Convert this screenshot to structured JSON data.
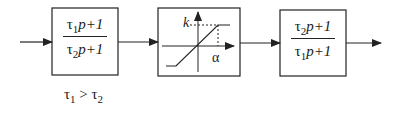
{
  "diagram": {
    "type": "block-diagram",
    "blocks": [
      {
        "id": "lead",
        "numerator": {
          "tau": "τ",
          "sub": "1",
          "rest": "p+1"
        },
        "denominator": {
          "tau": "τ",
          "sub": "2",
          "rest": "p+1"
        }
      },
      {
        "id": "saturation",
        "labels": {
          "k": "k",
          "alpha": "α"
        }
      },
      {
        "id": "lag",
        "numerator": {
          "tau": "τ",
          "sub": "2",
          "rest": "p+1"
        },
        "denominator": {
          "tau": "τ",
          "sub": "1",
          "rest": "p+1"
        }
      }
    ],
    "condition": {
      "left": "τ",
      "left_sub": "1",
      "op": " > ",
      "right": "τ",
      "right_sub": "2"
    },
    "colors": {
      "stroke": "#222222",
      "background": "#ffffff"
    }
  }
}
